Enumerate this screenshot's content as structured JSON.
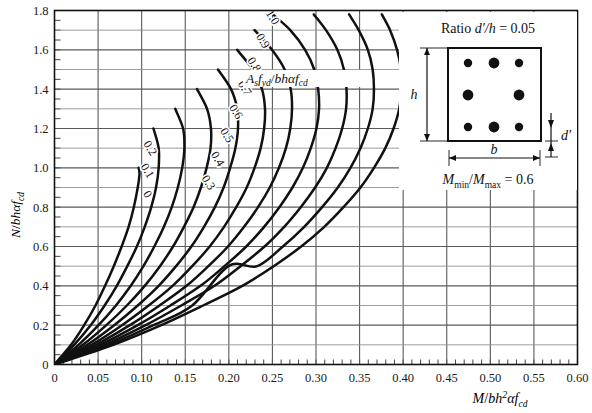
{
  "chart_data": {
    "type": "line",
    "title": "",
    "xlabel": "M/bh²αf_cd",
    "ylabel": "N/bhαf_cd",
    "xlim": [
      0,
      0.6
    ],
    "ylim": [
      0,
      1.8
    ],
    "xticks": [
      "0",
      "0.05",
      "0.10",
      "0.15",
      "0.20",
      "0.25",
      "0.30",
      "0.35",
      "0.40",
      "0.45",
      "0.50",
      "0.55",
      "0.60"
    ],
    "xtick_values": [
      0,
      0.05,
      0.1,
      0.15,
      0.2,
      0.25,
      0.3,
      0.35,
      0.4,
      0.45,
      0.5,
      0.55,
      0.6
    ],
    "yticks": [
      "0",
      "0.2",
      "0.4",
      "0.6",
      "0.8",
      "1.0",
      "1.2",
      "1.4",
      "1.6",
      "1.8"
    ],
    "ytick_values": [
      0,
      0.2,
      0.4,
      0.6,
      0.8,
      1.0,
      1.2,
      1.4,
      1.6,
      1.8
    ],
    "x_minor_step": 0.01,
    "y_minor_step": 0.05,
    "grid": true,
    "grid_x_step": 0.05,
    "grid_y_step": 0.1,
    "legend_position": "inline-curve-labels",
    "series_label": "A_s f_yd / bhαf_cd",
    "series": [
      {
        "name": "0",
        "label": "0",
        "label_x": 0.103,
        "label_y": 0.855,
        "points": [
          [
            0.0,
            0.0
          ],
          [
            0.019,
            0.1
          ],
          [
            0.034,
            0.2
          ],
          [
            0.047,
            0.3
          ],
          [
            0.058,
            0.4
          ],
          [
            0.068,
            0.5
          ],
          [
            0.077,
            0.6
          ],
          [
            0.085,
            0.7
          ],
          [
            0.091,
            0.8
          ],
          [
            0.0955,
            0.9
          ],
          [
            0.0975,
            0.97
          ],
          [
            0.0965,
            1.0
          ]
        ]
      },
      {
        "name": "0.1",
        "label": "0.1",
        "label_x": 0.103,
        "label_y": 0.975,
        "points": [
          [
            0.0,
            0.0
          ],
          [
            0.0225,
            0.1
          ],
          [
            0.0415,
            0.2
          ],
          [
            0.0575,
            0.3
          ],
          [
            0.0715,
            0.4
          ],
          [
            0.0835,
            0.5
          ],
          [
            0.0945,
            0.6
          ],
          [
            0.1035,
            0.7
          ],
          [
            0.111,
            0.8
          ],
          [
            0.1165,
            0.9
          ],
          [
            0.1195,
            1.0
          ],
          [
            0.1195,
            1.1
          ],
          [
            0.1135,
            1.2
          ]
        ]
      },
      {
        "name": "0.2",
        "label": "0.2",
        "label_x": 0.106,
        "label_y": 1.09,
        "points": [
          [
            0.0,
            0.0
          ],
          [
            0.0275,
            0.1
          ],
          [
            0.0505,
            0.2
          ],
          [
            0.0705,
            0.3
          ],
          [
            0.0875,
            0.4
          ],
          [
            0.102,
            0.5
          ],
          [
            0.1145,
            0.6
          ],
          [
            0.1255,
            0.7
          ],
          [
            0.1345,
            0.8
          ],
          [
            0.1415,
            0.9
          ],
          [
            0.1465,
            1.0
          ],
          [
            0.149,
            1.1
          ],
          [
            0.1475,
            1.2
          ],
          [
            0.1385,
            1.3
          ]
        ]
      },
      {
        "name": "0.3",
        "label": "0.3",
        "label_x": 0.173,
        "label_y": 0.915,
        "points": [
          [
            0.0,
            0.0
          ],
          [
            0.0325,
            0.1
          ],
          [
            0.0595,
            0.2
          ],
          [
            0.083,
            0.3
          ],
          [
            0.1035,
            0.4
          ],
          [
            0.121,
            0.5
          ],
          [
            0.136,
            0.6
          ],
          [
            0.1485,
            0.7
          ],
          [
            0.1595,
            0.8
          ],
          [
            0.168,
            0.9
          ],
          [
            0.1745,
            1.0
          ],
          [
            0.179,
            1.1
          ],
          [
            0.1795,
            1.2
          ],
          [
            0.175,
            1.3
          ],
          [
            0.1635,
            1.4
          ]
        ]
      },
      {
        "name": "0.4",
        "label": "0.4",
        "label_x": 0.1835,
        "label_y": 1.035,
        "points": [
          [
            0.0,
            0.0
          ],
          [
            0.0375,
            0.1
          ],
          [
            0.0685,
            0.2
          ],
          [
            0.0955,
            0.3
          ],
          [
            0.1195,
            0.4
          ],
          [
            0.1395,
            0.5
          ],
          [
            0.157,
            0.6
          ],
          [
            0.1715,
            0.7
          ],
          [
            0.184,
            0.8
          ],
          [
            0.194,
            0.9
          ],
          [
            0.2015,
            1.0
          ],
          [
            0.2075,
            1.1
          ],
          [
            0.2105,
            1.2
          ],
          [
            0.2095,
            1.3
          ],
          [
            0.2025,
            1.4
          ],
          [
            0.1875,
            1.5
          ]
        ]
      },
      {
        "name": "0.5",
        "label": "0.5",
        "label_x": 0.194,
        "label_y": 1.155,
        "points": [
          [
            0.0,
            0.0
          ],
          [
            0.0425,
            0.1
          ],
          [
            0.0775,
            0.2
          ],
          [
            0.108,
            0.3
          ],
          [
            0.1355,
            0.4
          ],
          [
            0.158,
            0.5
          ],
          [
            0.178,
            0.6
          ],
          [
            0.1945,
            0.7
          ],
          [
            0.2085,
            0.8
          ],
          [
            0.2205,
            0.9
          ],
          [
            0.2295,
            1.0
          ],
          [
            0.2365,
            1.1
          ],
          [
            0.2405,
            1.2
          ],
          [
            0.2415,
            1.3
          ],
          [
            0.238,
            1.4
          ],
          [
            0.2275,
            1.5
          ],
          [
            0.2095,
            1.6
          ]
        ]
      },
      {
        "name": "0.6",
        "label": "0.6",
        "label_x": 0.2045,
        "label_y": 1.275,
        "points": [
          [
            0.0,
            0.0
          ],
          [
            0.0475,
            0.1
          ],
          [
            0.0865,
            0.2
          ],
          [
            0.1205,
            0.3
          ],
          [
            0.1515,
            0.4
          ],
          [
            0.1765,
            0.5
          ],
          [
            0.199,
            0.6
          ],
          [
            0.2175,
            0.7
          ],
          [
            0.2335,
            0.8
          ],
          [
            0.247,
            0.9
          ],
          [
            0.2575,
            1.0
          ],
          [
            0.2655,
            1.1
          ],
          [
            0.2705,
            1.2
          ],
          [
            0.2725,
            1.3
          ],
          [
            0.271,
            1.4
          ],
          [
            0.264,
            1.5
          ],
          [
            0.2495,
            1.6
          ],
          [
            0.2295,
            1.7
          ]
        ]
      },
      {
        "name": "0.7",
        "label": "0.7",
        "label_x": 0.2145,
        "label_y": 1.395,
        "points": [
          [
            0.0,
            0.0
          ],
          [
            0.0525,
            0.1
          ],
          [
            0.0955,
            0.2
          ],
          [
            0.133,
            0.3
          ],
          [
            0.1675,
            0.4
          ],
          [
            0.195,
            0.5
          ],
          [
            0.22,
            0.6
          ],
          [
            0.2405,
            0.7
          ],
          [
            0.258,
            0.8
          ],
          [
            0.273,
            0.9
          ],
          [
            0.285,
            1.0
          ],
          [
            0.294,
            1.1
          ],
          [
            0.3005,
            1.2
          ],
          [
            0.3035,
            1.3
          ],
          [
            0.3025,
            1.4
          ],
          [
            0.298,
            1.5
          ],
          [
            0.2875,
            1.6
          ],
          [
            0.2705,
            1.7
          ],
          [
            0.2505,
            1.78
          ]
        ]
      },
      {
        "name": "0.8",
        "label": "0.8",
        "label_x": 0.2255,
        "label_y": 1.515,
        "points": [
          [
            0.0,
            0.0
          ],
          [
            0.0575,
            0.1
          ],
          [
            0.1045,
            0.2
          ],
          [
            0.1455,
            0.3
          ],
          [
            0.1835,
            0.4
          ],
          [
            0.2135,
            0.5
          ],
          [
            0.241,
            0.6
          ],
          [
            0.2635,
            0.7
          ],
          [
            0.2825,
            0.8
          ],
          [
            0.299,
            0.9
          ],
          [
            0.3125,
            1.0
          ],
          [
            0.3225,
            1.1
          ],
          [
            0.33,
            1.2
          ],
          [
            0.3345,
            1.3
          ],
          [
            0.335,
            1.4
          ],
          [
            0.332,
            1.5
          ],
          [
            0.3245,
            1.6
          ],
          [
            0.3115,
            1.7
          ],
          [
            0.2975,
            1.78
          ]
        ]
      },
      {
        "name": "0.9",
        "label": "0.9",
        "label_x": 0.2355,
        "label_y": 1.635,
        "points": [
          [
            0.0,
            0.0
          ],
          [
            0.0625,
            0.1
          ],
          [
            0.1135,
            0.2
          ],
          [
            0.158,
            0.3
          ],
          [
            0.1995,
            0.5
          ],
          [
            0.2325,
            0.5
          ],
          [
            0.262,
            0.6
          ],
          [
            0.2865,
            0.7
          ],
          [
            0.307,
            0.8
          ],
          [
            0.325,
            0.9
          ],
          [
            0.3395,
            1.0
          ],
          [
            0.351,
            1.1
          ],
          [
            0.3595,
            1.2
          ],
          [
            0.365,
            1.3
          ],
          [
            0.3665,
            1.4
          ],
          [
            0.365,
            1.5
          ],
          [
            0.3595,
            1.6
          ],
          [
            0.349,
            1.7
          ],
          [
            0.338,
            1.78
          ]
        ]
      },
      {
        "name": "1.0",
        "label": "1.0",
        "label_x": 0.2465,
        "label_y": 1.755,
        "points": [
          [
            0.0,
            0.0
          ],
          [
            0.0675,
            0.1
          ],
          [
            0.1225,
            0.2
          ],
          [
            0.1705,
            0.3
          ],
          [
            0.2155,
            0.4
          ],
          [
            0.2515,
            0.5
          ],
          [
            0.283,
            0.6
          ],
          [
            0.3095,
            0.7
          ],
          [
            0.3315,
            0.8
          ],
          [
            0.351,
            0.9
          ],
          [
            0.3665,
            1.0
          ],
          [
            0.3795,
            1.1
          ],
          [
            0.389,
            1.2
          ],
          [
            0.3955,
            1.3
          ],
          [
            0.398,
            1.4
          ],
          [
            0.3975,
            1.5
          ],
          [
            0.393,
            1.6
          ],
          [
            0.385,
            1.7
          ],
          [
            0.3755,
            1.78
          ]
        ]
      }
    ]
  },
  "inset": {
    "ratio_text": "Ratio d′/h = 0.05",
    "ratio_prefix": "Ratio",
    "ratio_symbol": "d′/h",
    "ratio_equals": "= 0.05",
    "moment_text": "M_min/M_max = 0.6",
    "moment_symbol_a": "M",
    "moment_sub_a": "min",
    "moment_symbol_b": "M",
    "moment_sub_b": "max",
    "moment_equals": "= 0.6",
    "dim_h": "h",
    "dim_b": "b",
    "dim_dprime": "d′",
    "rebar_count": 8,
    "rebar_layout": "3-2-3"
  },
  "axis": {
    "y_label_parts": {
      "n": "N",
      "slash": "/",
      "bh": "bh",
      "alpha": "α",
      "f": "f",
      "sub": "cd"
    },
    "x_label_parts": {
      "m": "M",
      "slash": "/",
      "bh": "bh",
      "sup": "2",
      "alpha": "α",
      "f": "f",
      "sub": "cd"
    }
  },
  "annotation": {
    "formula_as": "A",
    "formula_as_sub": "s",
    "formula_f": "f",
    "formula_f_sub": "yd",
    "formula_slash": "/",
    "formula_bh": "bh",
    "formula_alpha": "α",
    "formula_fcd": "f",
    "formula_fcd_sub": "cd"
  },
  "colors": {
    "curve": "#111111",
    "grid": "#5a5a5a",
    "grid_light": "#8c8c8c",
    "axis": "#111111",
    "background": "#ffffff",
    "rebar": "#111111"
  }
}
